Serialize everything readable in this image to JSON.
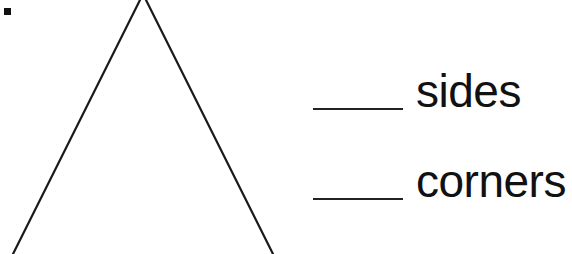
{
  "worksheet": {
    "shape": "triangle",
    "prompts": [
      {
        "blank_value": "",
        "label": "sides"
      },
      {
        "blank_value": "",
        "label": "corners"
      }
    ]
  }
}
